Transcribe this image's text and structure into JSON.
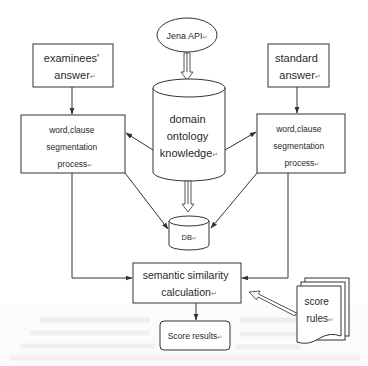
{
  "diagram": {
    "type": "flowchart",
    "nodes": {
      "jena_api": {
        "label": "Jena API",
        "shape": "ellipse"
      },
      "ontology": {
        "lines": [
          "domain",
          "ontology",
          "knowledge"
        ],
        "shape": "cylinder"
      },
      "examinees_answer": {
        "lines": [
          "examinees'",
          "answer"
        ],
        "shape": "rectangle"
      },
      "standard_answer": {
        "lines": [
          "standard",
          "answer"
        ],
        "shape": "rectangle"
      },
      "left_segmentation": {
        "lines": [
          "word,clause",
          "segmentation",
          "process"
        ],
        "shape": "rectangle"
      },
      "right_segmentation": {
        "lines": [
          "word,clause",
          "segmentation",
          "process"
        ],
        "shape": "rectangle"
      },
      "db": {
        "label": "DB",
        "shape": "cylinder"
      },
      "semantic_similarity": {
        "lines": [
          "semantic similarity",
          "calculation"
        ],
        "shape": "rectangle"
      },
      "score_results": {
        "label": "Score results",
        "shape": "rounded-rectangle"
      },
      "score_rules": {
        "lines": [
          "score",
          "rules"
        ],
        "shape": "document-stack"
      }
    },
    "edges": [
      {
        "from": "jena_api",
        "to": "ontology",
        "style": "hollow-double-arrow"
      },
      {
        "from": "examinees_answer",
        "to": "left_segmentation",
        "style": "arrow"
      },
      {
        "from": "standard_answer",
        "to": "right_segmentation",
        "style": "arrow"
      },
      {
        "from": "ontology",
        "to": "left_segmentation",
        "style": "arrow"
      },
      {
        "from": "ontology",
        "to": "right_segmentation",
        "style": "arrow"
      },
      {
        "from": "ontology",
        "to": "db",
        "style": "hollow-double-arrow"
      },
      {
        "from": "left_segmentation",
        "to": "db",
        "style": "arrow"
      },
      {
        "from": "right_segmentation",
        "to": "db",
        "style": "arrow"
      },
      {
        "from": "left_segmentation",
        "to": "semantic_similarity",
        "style": "elbow-arrow"
      },
      {
        "from": "right_segmentation",
        "to": "semantic_similarity",
        "style": "elbow-arrow"
      },
      {
        "from": "semantic_similarity",
        "to": "score_results",
        "style": "arrow"
      },
      {
        "from": "score_rules",
        "to": "semantic_similarity",
        "style": "hollow-arrow"
      }
    ],
    "paragraph_mark": "↵",
    "colors": {
      "stroke": "#3a3a3a",
      "text": "#2a2a2a",
      "background": "#ffffff"
    }
  }
}
